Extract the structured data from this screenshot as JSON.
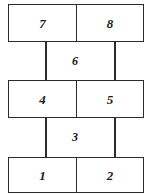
{
  "diagram": {
    "type": "ladder-graph",
    "rows": [
      {
        "name": "top-row",
        "cells": [
          {
            "label": "7"
          },
          {
            "label": "8"
          }
        ]
      },
      {
        "name": "middle-row",
        "cells": [
          {
            "label": "4"
          },
          {
            "label": "5"
          }
        ]
      },
      {
        "name": "bottom-row",
        "cells": [
          {
            "label": "1"
          },
          {
            "label": "2"
          }
        ]
      }
    ],
    "edge_labels": [
      {
        "name": "upper-gap-label",
        "label": "6"
      },
      {
        "name": "lower-gap-label",
        "label": "3"
      }
    ],
    "colors": {
      "stroke": "#2b2b2b",
      "text": "#1a1a1a",
      "background": "#ffffff"
    }
  }
}
